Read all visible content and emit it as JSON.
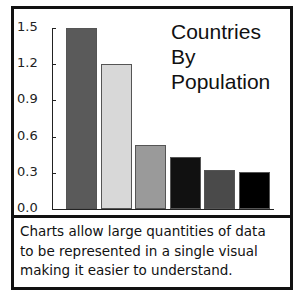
{
  "chart_data": {
    "type": "bar",
    "title": "Countries By Population",
    "title_lines": [
      "Countries",
      "By",
      "Population"
    ],
    "xlabel": "",
    "ylabel": "",
    "categories": [
      "1",
      "2",
      "3",
      "4",
      "5",
      "6"
    ],
    "values": [
      1.5,
      1.2,
      0.53,
      0.43,
      0.32,
      0.31
    ],
    "colors": [
      "#5a5a5a",
      "#d8d8d8",
      "#9a9a9a",
      "#111111",
      "#4a4a4a",
      "#000000"
    ],
    "ylim": [
      0,
      1.5
    ],
    "yticks": [
      "1.5",
      "1.2",
      "0.9",
      "0.6",
      "0.3",
      "0.0"
    ],
    "grid": false,
    "legend": "none"
  },
  "caption": {
    "lines": [
      "Charts allow large quantities of data",
      "to be represented in a single visual",
      "making it easier to understand."
    ]
  }
}
